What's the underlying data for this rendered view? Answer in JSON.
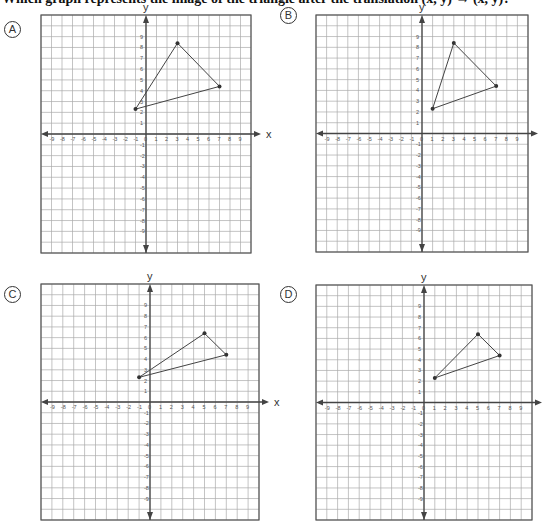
{
  "question": {
    "text": "Which graph represents the image of the triangle after the translation (x, y) → (x, y)?"
  },
  "chart_data": [
    {
      "type": "scatter",
      "option": "A",
      "title": "",
      "xlabel": "x",
      "ylabel": "y",
      "xlim": [
        -10,
        10
      ],
      "ylim": [
        -11,
        11
      ],
      "grid": true,
      "x_ticks": [
        -9,
        -8,
        -7,
        -6,
        -5,
        -4,
        -3,
        -2,
        -1,
        0,
        1,
        2,
        3,
        4,
        5,
        6,
        7,
        8,
        9
      ],
      "y_ticks": [
        9,
        8,
        7,
        6,
        5,
        4,
        3,
        2,
        1,
        -1,
        -2,
        -3,
        -4,
        -5,
        -6,
        -7,
        -8,
        -9
      ],
      "triangle": [
        [
          -1,
          2.3
        ],
        [
          3,
          8.4
        ],
        [
          7,
          4.4
        ]
      ]
    },
    {
      "type": "scatter",
      "option": "B",
      "title": "",
      "xlabel": "x",
      "ylabel": "y",
      "xlim": [
        -10,
        10
      ],
      "ylim": [
        -11,
        11
      ],
      "grid": true,
      "x_ticks": [
        -9,
        -8,
        -7,
        -6,
        -5,
        -4,
        -3,
        -2,
        -1,
        0,
        1,
        2,
        3,
        4,
        5,
        6,
        7,
        8,
        9
      ],
      "y_ticks": [
        9,
        8,
        7,
        6,
        5,
        4,
        3,
        2,
        1,
        -1,
        -2,
        -3,
        -4,
        -5,
        -6,
        -7,
        -8,
        -9
      ],
      "triangle": [
        [
          1,
          2.3
        ],
        [
          3,
          8.4
        ],
        [
          7,
          4.4
        ]
      ]
    },
    {
      "type": "scatter",
      "option": "C",
      "title": "",
      "xlabel": "x",
      "ylabel": "y",
      "xlim": [
        -10,
        10
      ],
      "ylim": [
        -11,
        11
      ],
      "grid": true,
      "x_ticks": [
        -9,
        -8,
        -7,
        -6,
        -5,
        -4,
        -3,
        -2,
        -1,
        0,
        1,
        2,
        3,
        4,
        5,
        6,
        7,
        8,
        9
      ],
      "y_ticks": [
        9,
        8,
        7,
        6,
        5,
        4,
        3,
        2,
        1,
        -1,
        -2,
        -3,
        -4,
        -5,
        -6,
        -7,
        -8,
        -9
      ],
      "triangle": [
        [
          -1,
          2.3
        ],
        [
          5,
          6.4
        ],
        [
          7,
          4.4
        ]
      ]
    },
    {
      "type": "scatter",
      "option": "D",
      "title": "",
      "xlabel": "x",
      "ylabel": "y",
      "xlim": [
        -10,
        10
      ],
      "ylim": [
        -11,
        11
      ],
      "grid": true,
      "x_ticks": [
        -9,
        -8,
        -7,
        -6,
        -5,
        -4,
        -3,
        -2,
        -1,
        0,
        1,
        2,
        3,
        4,
        5,
        6,
        7,
        8,
        9
      ],
      "y_ticks": [
        9,
        8,
        7,
        6,
        5,
        4,
        3,
        2,
        1,
        -1,
        -2,
        -3,
        -4,
        -5,
        -6,
        -7,
        -8,
        -9
      ],
      "triangle": [
        [
          1,
          2.3
        ],
        [
          5,
          6.4
        ],
        [
          7,
          4.4
        ]
      ]
    }
  ],
  "options": [
    {
      "label": "A",
      "left": 41,
      "top": 15,
      "width": 210,
      "height": 238,
      "badge_x": 4,
      "badge_y": 21
    },
    {
      "label": "B",
      "left": 316,
      "top": 15,
      "width": 212,
      "height": 237,
      "badge_x": 280,
      "badge_y": 7
    },
    {
      "label": "C",
      "left": 41,
      "top": 284,
      "width": 218,
      "height": 236,
      "badge_x": 4,
      "badge_y": 286
    },
    {
      "label": "D",
      "left": 316,
      "top": 285,
      "width": 216,
      "height": 235,
      "badge_x": 280,
      "badge_y": 286
    }
  ]
}
